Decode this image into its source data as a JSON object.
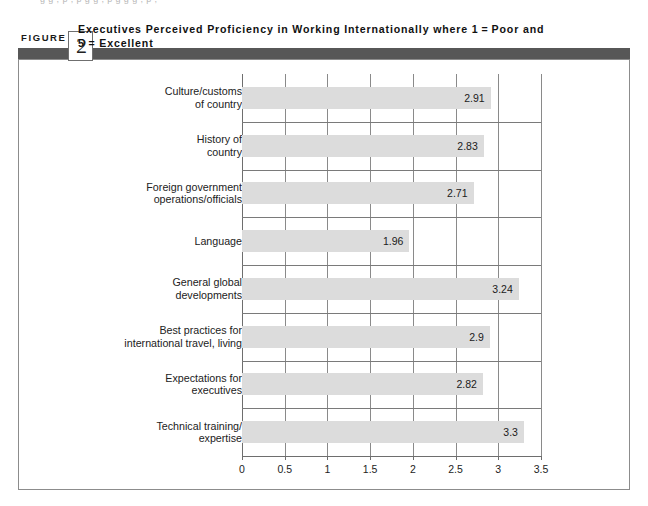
{
  "page": {
    "bleed_text": "g g , p , p g g , p g g g , p ,",
    "figure_word": "FIGURE",
    "figure_number": "2",
    "title_line1": "Executives Perceived Proficiency in Working Internationally where 1 = Poor and",
    "title_line2": "5  =  Excellent",
    "band_color": "#575757",
    "frame_color": "#8c8c8c"
  },
  "chart_data": {
    "type": "bar",
    "orientation": "horizontal",
    "xlabel": "",
    "ylabel": "",
    "xlim": [
      0,
      3.5
    ],
    "xticks": [
      "0",
      "0.5",
      "1",
      "1.5",
      "2",
      "2.5",
      "3",
      "3.5"
    ],
    "xtick_values": [
      0,
      0.5,
      1,
      1.5,
      2,
      2.5,
      3,
      3.5
    ],
    "grid": true,
    "legend": false,
    "bar_color": "#dcdcdc",
    "categories": [
      "Culture/customs of country",
      "History of country",
      "Foreign government operations/officials",
      "Language",
      "General global developments",
      "Best practices for international travel, living",
      "Expectations for executives",
      "Technical training/ expertise"
    ],
    "category_lines": [
      [
        "Culture/customs",
        "of country"
      ],
      [
        "History of",
        "country"
      ],
      [
        "Foreign government",
        "operations/officials"
      ],
      [
        "Language"
      ],
      [
        "General global",
        "developments"
      ],
      [
        "Best practices for",
        "international travel, living"
      ],
      [
        "Expectations for",
        "executives"
      ],
      [
        "Technical training/",
        "expertise"
      ]
    ],
    "values": [
      2.91,
      2.83,
      2.71,
      1.96,
      3.24,
      2.9,
      2.82,
      3.3
    ],
    "value_labels": [
      "2.91",
      "2.83",
      "2.71",
      "1.96",
      "3.24",
      "2.9",
      "2.82",
      "3.3"
    ]
  }
}
